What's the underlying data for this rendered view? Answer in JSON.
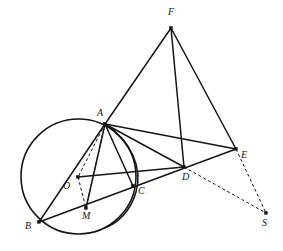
{
  "figure": {
    "kind": "euclidean-geometry-diagram",
    "width": 283,
    "height": 251,
    "background": "#ffffff",
    "stroke_color": "#151515",
    "point_color": "#111111",
    "label_color": "#141414",
    "solid_stroke_width": 1.5,
    "dashed_stroke_width": 1.0,
    "circle_stroke_width": 1.6,
    "dash_pattern": "3,2.5",
    "points": [
      {
        "id": "F",
        "label": "F",
        "x": 171,
        "y": 28,
        "lx": 168,
        "ly": 7,
        "marker": true
      },
      {
        "id": "A",
        "label": "A",
        "x": 105,
        "y": 124,
        "lx": 97,
        "ly": 108,
        "marker": true
      },
      {
        "id": "E",
        "label": "E",
        "x": 236,
        "y": 149,
        "lx": 241,
        "ly": 150,
        "marker": true
      },
      {
        "id": "D",
        "label": "D",
        "x": 184,
        "y": 167,
        "lx": 182,
        "ly": 172,
        "marker": true
      },
      {
        "id": "C",
        "label": "C",
        "x": 133,
        "y": 186,
        "lx": 138,
        "ly": 186,
        "marker": true
      },
      {
        "id": "O",
        "label": "O",
        "x": 78,
        "y": 177,
        "lx": 63,
        "ly": 181,
        "marker": true
      },
      {
        "id": "M",
        "label": "M",
        "x": 86,
        "y": 208,
        "lx": 82,
        "ly": 211,
        "marker": true
      },
      {
        "id": "B",
        "label": "B",
        "x": 39,
        "y": 222,
        "lx": 25,
        "ly": 221,
        "marker": true
      },
      {
        "id": "S",
        "label": "S",
        "x": 266,
        "y": 213,
        "lx": 262,
        "ly": 218,
        "marker": true
      }
    ],
    "circles": [
      {
        "id": "main-circle",
        "label": "circumcircle-O",
        "cx": 78.5,
        "cy": 176.5,
        "r": 57.5,
        "style": "solid"
      }
    ],
    "arcs": [
      {
        "id": "second-arc",
        "label": "arc-through-A-C",
        "d": "M 105 124 C 131 141 143 168 136 192 C 131 210 118 224 104 228",
        "style": "solid"
      }
    ],
    "segments": [
      {
        "id": "FA",
        "from": "F",
        "to": "A",
        "style": "solid"
      },
      {
        "id": "FD",
        "from": "F",
        "to": "D",
        "style": "solid"
      },
      {
        "id": "FE",
        "from": "F",
        "to": "E",
        "style": "solid"
      },
      {
        "id": "AB",
        "from": "A",
        "to": "B",
        "style": "solid"
      },
      {
        "id": "AM",
        "from": "A",
        "to": "M",
        "style": "solid"
      },
      {
        "id": "AC",
        "from": "A",
        "to": "C",
        "style": "solid"
      },
      {
        "id": "AD",
        "from": "A",
        "to": "D",
        "style": "solid"
      },
      {
        "id": "AE",
        "from": "A",
        "to": "E",
        "style": "solid"
      },
      {
        "id": "OD",
        "from": "O",
        "to": "D",
        "style": "solid"
      },
      {
        "id": "BE",
        "from": "B",
        "to": "E",
        "style": "solid"
      },
      {
        "id": "DE",
        "from": "D",
        "to": "E",
        "style": "solid"
      },
      {
        "id": "AO",
        "from": "A",
        "to": "O",
        "style": "dashed"
      },
      {
        "id": "OM",
        "from": "O",
        "to": "M",
        "style": "dashed"
      },
      {
        "id": "AMext",
        "from": "A",
        "to": "M",
        "style": "dashed"
      },
      {
        "id": "DS",
        "from": "D",
        "to": "S",
        "style": "dashed"
      },
      {
        "id": "ES",
        "from": "E",
        "to": "S",
        "style": "dashed"
      }
    ]
  }
}
